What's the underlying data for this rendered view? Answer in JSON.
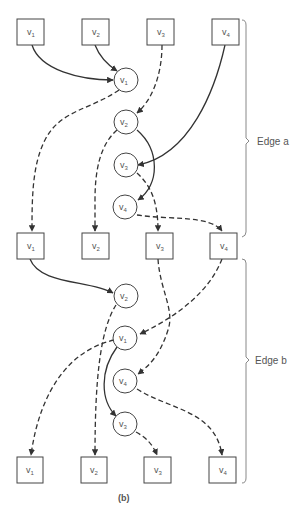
{
  "diagram": {
    "caption": "(b)",
    "colors": {
      "stroke": "#333333",
      "text": "#555555",
      "background": "#ffffff"
    },
    "stages": [
      {
        "name": "Edge a",
        "label": "Edge a"
      },
      {
        "name": "Edge b",
        "label": "Edge b"
      }
    ],
    "square_rows": [
      {
        "row": "top",
        "nodes": [
          {
            "id": "t1",
            "base": "v",
            "sub": "1"
          },
          {
            "id": "t2",
            "base": "v",
            "sub": "2"
          },
          {
            "id": "t3",
            "base": "v",
            "sub": "3"
          },
          {
            "id": "t4",
            "base": "v",
            "sub": "4"
          }
        ]
      },
      {
        "row": "middle",
        "nodes": [
          {
            "id": "m1",
            "base": "v",
            "sub": "1"
          },
          {
            "id": "m2",
            "base": "v",
            "sub": "2"
          },
          {
            "id": "m3",
            "base": "v",
            "sub": "3"
          },
          {
            "id": "m4",
            "base": "v",
            "sub": "4"
          }
        ]
      },
      {
        "row": "bottom",
        "nodes": [
          {
            "id": "b1",
            "base": "v",
            "sub": "1"
          },
          {
            "id": "b2",
            "base": "v",
            "sub": "2"
          },
          {
            "id": "b3",
            "base": "v",
            "sub": "3"
          },
          {
            "id": "b4",
            "base": "v",
            "sub": "4"
          }
        ]
      }
    ],
    "circle_groups": [
      {
        "stage": "Edge a",
        "nodes": [
          {
            "id": "ca1",
            "base": "v",
            "sub": "1"
          },
          {
            "id": "ca2",
            "base": "v",
            "sub": "2"
          },
          {
            "id": "ca3",
            "base": "v",
            "sub": "3"
          },
          {
            "id": "ca4",
            "base": "v",
            "sub": "4"
          }
        ]
      },
      {
        "stage": "Edge b",
        "nodes": [
          {
            "id": "cb2",
            "base": "v",
            "sub": "2"
          },
          {
            "id": "cb1",
            "base": "v",
            "sub": "1"
          },
          {
            "id": "cb4",
            "base": "v",
            "sub": "4"
          },
          {
            "id": "cb3",
            "base": "v",
            "sub": "3"
          }
        ]
      }
    ],
    "edges": [
      {
        "from": "t1",
        "to": "ca1",
        "style": "solid"
      },
      {
        "from": "t2",
        "to": "ca1",
        "style": "solid"
      },
      {
        "from": "t3",
        "to": "ca2",
        "style": "dashed"
      },
      {
        "from": "t4",
        "to": "ca3",
        "style": "solid"
      },
      {
        "from": "ca1",
        "to": "m1",
        "style": "dashed"
      },
      {
        "from": "ca2",
        "to": "m2",
        "style": "dashed"
      },
      {
        "from": "ca2",
        "to": "ca4",
        "style": "solid"
      },
      {
        "from": "ca3",
        "to": "m3",
        "style": "dashed"
      },
      {
        "from": "ca4",
        "to": "m4",
        "style": "dashed"
      },
      {
        "from": "m1",
        "to": "cb2",
        "style": "solid"
      },
      {
        "from": "m3",
        "to": "cb4",
        "style": "dashed"
      },
      {
        "from": "m4",
        "to": "cb1",
        "style": "dashed"
      },
      {
        "from": "cb2",
        "to": "b2",
        "style": "dashed"
      },
      {
        "from": "cb1",
        "to": "b1",
        "style": "dashed"
      },
      {
        "from": "cb1",
        "to": "cb3",
        "style": "solid"
      },
      {
        "from": "cb4",
        "to": "b4",
        "style": "dashed"
      },
      {
        "from": "cb3",
        "to": "b3",
        "style": "dashed"
      }
    ]
  }
}
